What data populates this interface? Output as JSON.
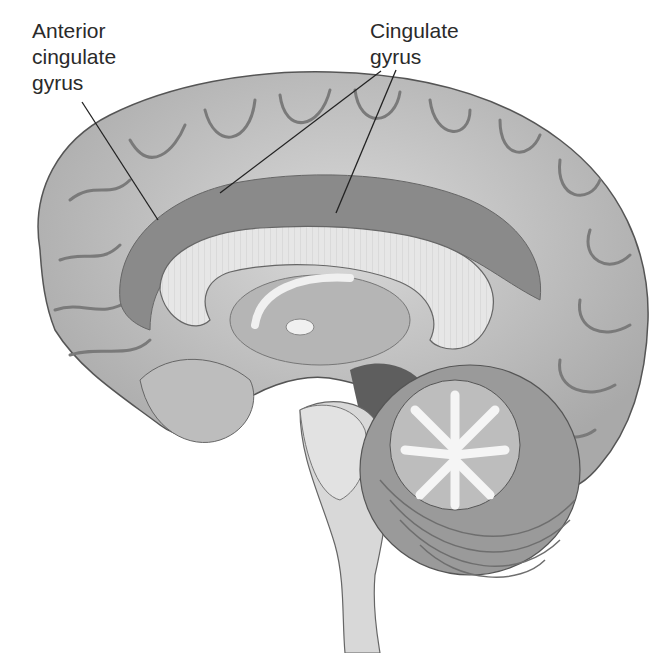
{
  "diagram": {
    "labels": [
      {
        "id": "anterior-cingulate-gyrus",
        "lines": [
          "Anterior",
          "cingulate",
          "gyrus"
        ],
        "text_pos": [
          32,
          18
        ],
        "leaders": [
          [
            [
              82,
              102
            ],
            [
              158,
              220
            ]
          ]
        ]
      },
      {
        "id": "cingulate-gyrus",
        "lines": [
          "Cingulate",
          "gyrus"
        ],
        "text_pos": [
          370,
          18
        ],
        "leaders": [
          [
            [
              381,
              71
            ],
            [
              220,
              193
            ]
          ],
          [
            [
              396,
              70
            ],
            [
              336,
              213
            ]
          ]
        ]
      }
    ]
  },
  "colors": {
    "background": "#ffffff",
    "cortex": "#c9c9c9",
    "cingulate": "#7f7f7f",
    "corpus_callosum": "#e4e4e4",
    "white_matter": "#f2f2f2",
    "brainstem": "#d8d8d8",
    "dark_fill": "#5e5e5e",
    "text": "#2a2a2a"
  }
}
